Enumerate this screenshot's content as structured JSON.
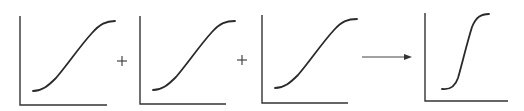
{
  "diagram": {
    "colors": {
      "line": "#2a2a2a",
      "axis": "#333333",
      "background": "#ffffff"
    },
    "panels": [
      {
        "id": "panel-1",
        "type": "sigmoid-gradual",
        "label": ""
      },
      {
        "id": "panel-2",
        "type": "sigmoid-gradual",
        "label": ""
      },
      {
        "id": "panel-3",
        "type": "sigmoid-gradual",
        "label": ""
      },
      {
        "id": "panel-4",
        "type": "sigmoid-steep",
        "label": ""
      }
    ],
    "operators": [
      {
        "symbol": "+",
        "between": [
          "panel-1",
          "panel-2"
        ]
      },
      {
        "symbol": "+",
        "between": [
          "panel-2",
          "panel-3"
        ]
      },
      {
        "symbol": "arrow",
        "between": [
          "panel-3",
          "panel-4"
        ]
      }
    ]
  }
}
